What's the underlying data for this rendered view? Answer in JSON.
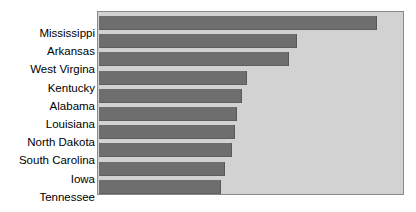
{
  "chart_data": {
    "type": "bar",
    "orientation": "horizontal",
    "title": "",
    "xlabel": "",
    "ylabel": "",
    "grid": false,
    "legend": null,
    "axis_ticks_visible": false,
    "categories": [
      "Mississippi",
      "Arkansas",
      "West Virgina",
      "Kentucky",
      "Alabama",
      "Louisiana",
      "North Dakota",
      "South Carolina",
      "Iowa",
      "Tennessee"
    ],
    "values": [
      91.4,
      65.1,
      62.5,
      48.7,
      47.0,
      45.4,
      44.7,
      43.8,
      41.4,
      40.1
    ],
    "xlim": [
      0,
      100
    ],
    "bar_color": "#6e6e6e",
    "plot_background": "#d2d2d2",
    "frame_color": "#8a8a8a",
    "page_background": "#ffffff"
  },
  "chart": {
    "title_fragment": ""
  }
}
